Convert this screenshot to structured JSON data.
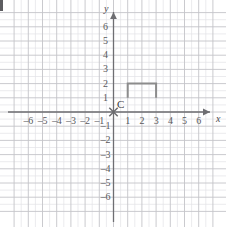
{
  "figure": {
    "width": 226,
    "height": 227,
    "background": "#ffffff",
    "artifact_label": ""
  },
  "chart_data": {
    "type": "scatter",
    "title": "",
    "xlabel": "x",
    "ylabel": "y",
    "xlim": [
      -7,
      7
    ],
    "ylim": [
      -7,
      7
    ],
    "grid": true,
    "minor_grid": true,
    "grid_step": 1,
    "minor_grid_step": 0.5,
    "legend": "none",
    "axis_arrows": [
      "x-positive",
      "y-positive"
    ],
    "x_tick_labels": [
      "–6",
      "–5",
      "–4",
      "–3",
      "–2",
      "–1",
      "1",
      "2",
      "3",
      "4",
      "5",
      "6"
    ],
    "x_tick_values": [
      -6,
      -5,
      -4,
      -3,
      -2,
      -1,
      1,
      2,
      3,
      4,
      5,
      6
    ],
    "y_tick_labels": [
      "6",
      "5",
      "4",
      "3",
      "2",
      "1",
      "–1",
      "–2",
      "–3",
      "–4",
      "–5",
      "–6"
    ],
    "y_tick_values": [
      6,
      5,
      4,
      3,
      2,
      1,
      -1,
      -2,
      -3,
      -4,
      -5,
      -6
    ],
    "points": [
      {
        "label": "C",
        "x": 0,
        "y": 0,
        "marker": "x-cross",
        "color": "#6b6b6e"
      }
    ],
    "shapes": [
      {
        "name": "staple-polyline",
        "type": "polyline",
        "closed": false,
        "color": "#8c8c8c",
        "stroke_width": 2,
        "vertices": [
          {
            "x": 1,
            "y": 1
          },
          {
            "x": 1,
            "y": 2
          },
          {
            "x": 3,
            "y": 2
          },
          {
            "x": 3,
            "y": 1
          }
        ]
      }
    ],
    "colors": {
      "axis": "#6e6e72",
      "major_grid": "#c4c4c8",
      "minor_grid": "#e2e2e6",
      "shape": "#8c8c8c",
      "tick_text": "#59595c",
      "background": "#ffffff"
    }
  },
  "labels": {
    "x_axis_name": "x",
    "y_axis_name": "y",
    "point_c": "C"
  }
}
